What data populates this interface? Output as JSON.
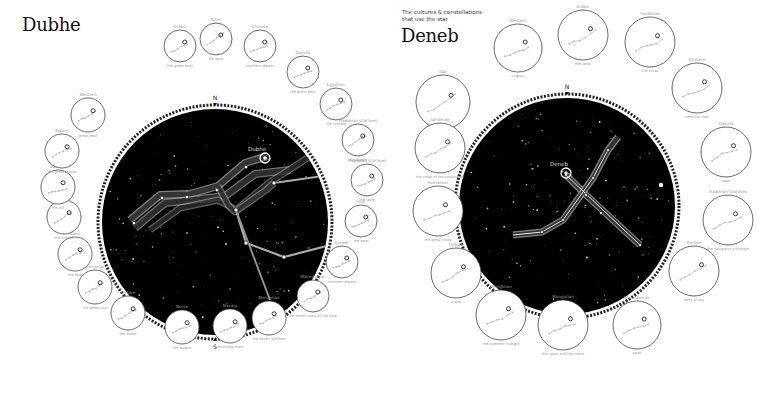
{
  "left": {
    "title": "Dubhe",
    "highlight_star": "Dubhe",
    "compass": {
      "north": "N",
      "south": "S"
    },
    "sky": {
      "cx": 215,
      "cy": 222,
      "r": 113
    },
    "cultures": [
      {
        "name": "Arabic",
        "subtitle": "the great bear"
      },
      {
        "name": "Aztec",
        "subtitle": "the bear"
      },
      {
        "name": "Chinese",
        "subtitle": "northern dipper"
      },
      {
        "name": "Dakota",
        "subtitle": "the great bear"
      },
      {
        "name": "Egyptian",
        "subtitle": "the foreleg"
      },
      {
        "name": "Hawaiian starlines",
        "subtitle": "the dipper"
      },
      {
        "name": "Hawaiian starlines",
        "subtitle": "the ladle"
      },
      {
        "name": "Inuit",
        "subtitle": "the bear"
      },
      {
        "name": "Korean",
        "subtitle": "northern dipper"
      },
      {
        "name": "Macedonian",
        "subtitle": "the seven stars of the bear"
      },
      {
        "name": "Mongolian",
        "subtitle": "the seven old men"
      },
      {
        "name": "Navajo",
        "subtitle": "revolving male"
      },
      {
        "name": "Norse",
        "subtitle": "the wagon"
      },
      {
        "name": "Ojibwe",
        "subtitle": "the fisher"
      },
      {
        "name": "Romanian",
        "subtitle": "the great cart"
      },
      {
        "name": "Sami",
        "subtitle": "the bow"
      },
      {
        "name": "Sardinian",
        "subtitle": "the chariot"
      },
      {
        "name": "Siberian",
        "subtitle": "the elk"
      },
      {
        "name": "Tukano",
        "subtitle": "the great jaguar"
      },
      {
        "name": "Western",
        "subtitle": "great bear"
      }
    ]
  },
  "right": {
    "subtitle_line1": "The cultures & constellations",
    "subtitle_line2": "that use the star",
    "title": "Deneb",
    "highlight_star": "Deneb",
    "compass": {
      "north": "N",
      "south": "S"
    },
    "sky": {
      "cx": 567,
      "cy": 206,
      "r": 108
    },
    "cultures": [
      {
        "name": "Tupi",
        "subtitle": "tapir"
      },
      {
        "name": "Western",
        "subtitle": "cygnus"
      },
      {
        "name": "Arabic",
        "subtitle": "the swan"
      },
      {
        "name": "Sardinian",
        "subtitle": "the cross"
      },
      {
        "name": "Chinese",
        "subtitle": "celestial ford"
      },
      {
        "name": "Dakota",
        "subtitle": "swan"
      },
      {
        "name": "Hawaiian starlines",
        "subtitle": "the navigator's triangle"
      },
      {
        "name": "Korean",
        "subtitle": "ferry of sky"
      },
      {
        "name": "Macedonian",
        "subtitle": "swan"
      },
      {
        "name": "Mongolian",
        "subtitle": "the swan and the crane"
      },
      {
        "name": "Mongolian",
        "subtitle": "the summer triangle"
      },
      {
        "name": "Ojibwe",
        "subtitle": "crane"
      },
      {
        "name": "Romanian",
        "subtitle": "the great cross"
      },
      {
        "name": "Sardinian",
        "subtitle": "the cross of the crossroads"
      }
    ]
  },
  "colors": {
    "sky": "#000000",
    "ring": "#333333",
    "line": "#cfcfcf",
    "label": "#999999"
  }
}
